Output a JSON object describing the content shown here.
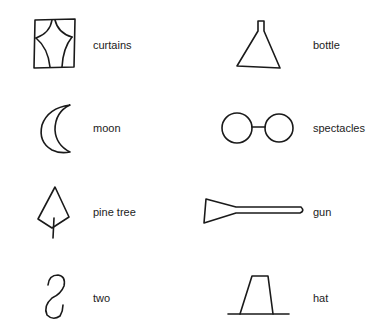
{
  "figure": {
    "items": [
      {
        "id": "curtains",
        "label": "curtains",
        "column": "left",
        "row": 1
      },
      {
        "id": "bottle",
        "label": "bottle",
        "column": "right",
        "row": 1
      },
      {
        "id": "moon",
        "label": "moon",
        "column": "left",
        "row": 2
      },
      {
        "id": "spectacles",
        "label": "spectacles",
        "column": "right",
        "row": 2
      },
      {
        "id": "pine-tree",
        "label": "pine tree",
        "column": "left",
        "row": 3
      },
      {
        "id": "gun",
        "label": "gun",
        "column": "right",
        "row": 3
      },
      {
        "id": "two",
        "label": "two",
        "column": "left",
        "row": 4
      },
      {
        "id": "hat",
        "label": "hat",
        "column": "right",
        "row": 4
      }
    ],
    "colors": {
      "stroke": "#1a1a1a",
      "text": "#222222",
      "background": "#ffffff"
    }
  }
}
